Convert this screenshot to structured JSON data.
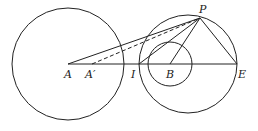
{
  "diagram": {
    "labels": {
      "A": "A",
      "A_prime": "A′",
      "I": "I",
      "B": "B",
      "E": "E",
      "P": "P"
    },
    "colors": {
      "stroke": "#222222",
      "background": "#ffffff"
    }
  }
}
